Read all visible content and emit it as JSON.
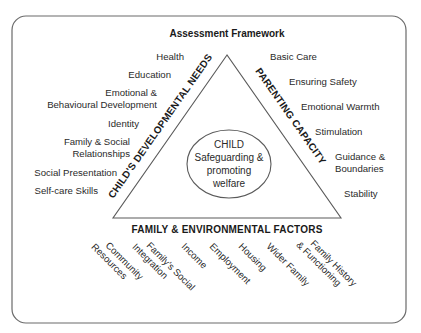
{
  "title": "Assessment Framework",
  "center": {
    "lines": [
      "CHILD",
      "Safeguarding &",
      "promoting",
      "welfare"
    ]
  },
  "sides": {
    "left": "CHILD'S DEVELOPMENTAL NEEDS",
    "right": "PARENTING CAPACITY",
    "bottom": "FAMILY & ENVIRONMENTAL FACTORS"
  },
  "left_items": [
    {
      "lines": [
        "Health"
      ]
    },
    {
      "lines": [
        "Education"
      ]
    },
    {
      "lines": [
        "Emotional &",
        "Behavioural Development"
      ]
    },
    {
      "lines": [
        "Identity"
      ]
    },
    {
      "lines": [
        "Family & Social",
        "Relationships"
      ]
    },
    {
      "lines": [
        "Social Presentation"
      ]
    },
    {
      "lines": [
        "Self-care Skills"
      ]
    }
  ],
  "right_items": [
    {
      "lines": [
        "Basic Care"
      ]
    },
    {
      "lines": [
        "Ensuring Safety"
      ]
    },
    {
      "lines": [
        "Emotional Warmth"
      ]
    },
    {
      "lines": [
        "Stimulation"
      ]
    },
    {
      "lines": [
        "Guidance &",
        "Boundaries"
      ]
    },
    {
      "lines": [
        "Stability"
      ]
    }
  ],
  "bottom_items": [
    {
      "lines": [
        "Community",
        "Resources"
      ]
    },
    {
      "lines": [
        "Family's Social",
        "Integration"
      ]
    },
    {
      "lines": [
        "Income"
      ]
    },
    {
      "lines": [
        "Employment"
      ]
    },
    {
      "lines": [
        "Housing"
      ]
    },
    {
      "lines": [
        "Wider Family"
      ]
    },
    {
      "lines": [
        "Family History",
        "& Functioning"
      ]
    }
  ],
  "colors": {
    "line": "#5a5a5a",
    "text": "#2a2a2a",
    "background": "#ffffff"
  }
}
